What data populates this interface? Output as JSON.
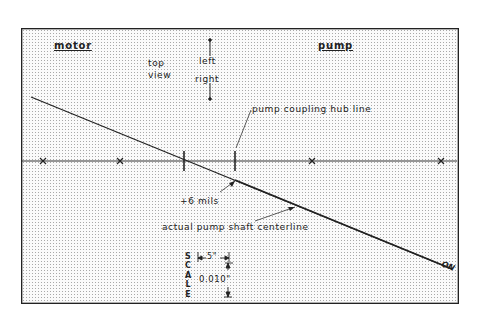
{
  "diagram": {
    "type": "shaft-alignment-graph",
    "labels": {
      "motor": "motor",
      "pump": "pump",
      "top_view_line1": "top",
      "top_view_line2": "view",
      "left": "left",
      "right": "right",
      "pump_coupling_hub_line": "pump coupling hub line",
      "offset": "+6 mils",
      "actual_shaft": "actual pump shaft centerline",
      "on_marker": "ON"
    },
    "scale": {
      "title_letters": [
        "S",
        "C",
        "A",
        "L",
        "E"
      ],
      "horizontal": "5\"",
      "vertical": "0.010\""
    },
    "colors": {
      "line": "#222222",
      "grid_dot": "#a8a8a8",
      "background": "#fafafa"
    },
    "reference_line": {
      "y": 161,
      "markers_x": [
        43,
        120,
        312,
        441
      ]
    },
    "tick_marks_x": [
      184,
      235
    ],
    "shaft_line": {
      "x1": 31,
      "y1": 97,
      "x2": 452,
      "y2": 269
    }
  }
}
